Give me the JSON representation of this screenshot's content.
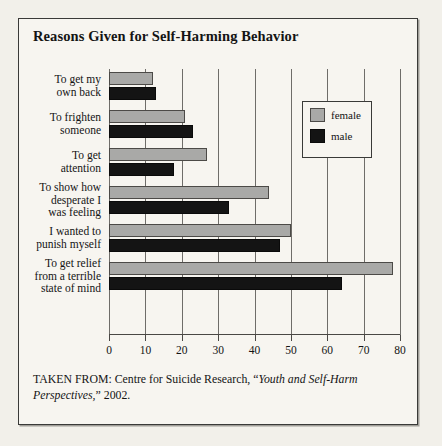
{
  "figure": {
    "title": "Reasons Given for Self-Harming Behavior",
    "caption_prefix": "TAKEN FROM: Centre for Suicide Research, “",
    "caption_italic": "Youth and Self-Harm Perspectives,",
    "caption_suffix": "” 2002."
  },
  "legend": {
    "position": "inside-upper-right",
    "entries": [
      {
        "label": "female",
        "color": "#a9a9a7"
      },
      {
        "label": "male",
        "color": "#141414"
      }
    ]
  },
  "chart_data": {
    "type": "bar",
    "orientation": "horizontal",
    "title": "Reasons Given for Self-Harming Behavior",
    "xlabel": "",
    "ylabel": "",
    "xlim": [
      0,
      80
    ],
    "xticks": [
      0,
      10,
      20,
      30,
      40,
      50,
      60,
      70,
      80
    ],
    "xtick_labels": [
      "0",
      "10",
      "20",
      "30",
      "40",
      "50",
      "60",
      "70",
      "80"
    ],
    "grid": "vertical",
    "categories": [
      "To get my own back",
      "To frighten someone",
      "To get attention",
      "To show how desperate I was feeling",
      "I wanted to punish myself",
      "To get relief from a terrible state of mind"
    ],
    "category_lines": [
      [
        "To get my",
        "own back"
      ],
      [
        "To frighten",
        "someone"
      ],
      [
        "To get",
        "attention"
      ],
      [
        "To show how",
        "desperate I",
        "was feeling"
      ],
      [
        "I wanted to",
        "punish myself"
      ],
      [
        "To get relief",
        "from a terrible",
        "state of mind"
      ]
    ],
    "series": [
      {
        "name": "female",
        "color": "#a9a9a7",
        "values": [
          12,
          21,
          27,
          44,
          50,
          78
        ]
      },
      {
        "name": "male",
        "color": "#141414",
        "values": [
          13,
          23,
          18,
          33,
          47,
          64
        ]
      }
    ]
  }
}
